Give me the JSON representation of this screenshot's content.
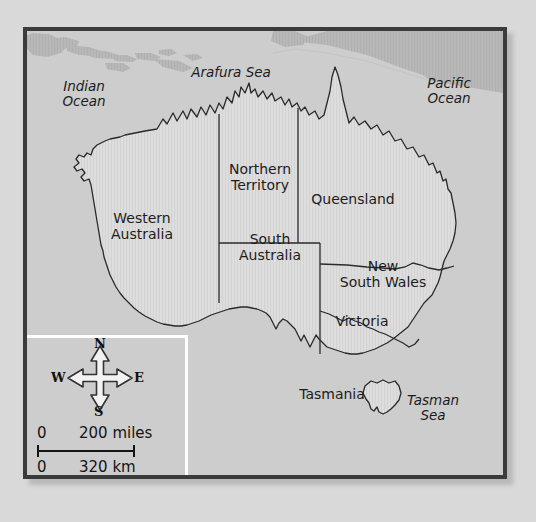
{
  "figure": {
    "type": "political-map",
    "region": "Australia",
    "colors": {
      "page_background": "#d9d9d9",
      "frame_border": "#3b3b3b",
      "ocean_fill": "#cdcdcd",
      "land_fill": "#dcdcdc",
      "foreign_land_fill": "#b6b6b6",
      "coastline_stroke": "#2a2a2a",
      "border_stroke": "#2a2a2a",
      "label_text": "#1c1c1c",
      "inset_divider": "#ffffff"
    }
  },
  "water_labels": [
    {
      "name": "indian-ocean",
      "text": "Indian\nOcean",
      "x": 48,
      "y": 57
    },
    {
      "name": "arafura-sea",
      "text": "Arafura Sea",
      "x": 185,
      "y": 40
    },
    {
      "name": "pacific-ocean",
      "text": "Pacific\nOcean",
      "x": 390,
      "y": 53
    },
    {
      "name": "tasman-sea",
      "text": "Tasman\nSea",
      "x": 370,
      "y": 372
    }
  ],
  "state_labels": [
    {
      "name": "western-australia",
      "text": "Western\nAustralia",
      "x": 90,
      "y": 178
    },
    {
      "name": "northern-territory",
      "text": "Northern\nTerritory",
      "x": 195,
      "y": 130
    },
    {
      "name": "queensland",
      "text": "Queensland",
      "x": 283,
      "y": 159
    },
    {
      "name": "south-australia",
      "text": "South\nAustralia",
      "x": 203,
      "y": 204
    },
    {
      "name": "new-south-wales",
      "text": "New\nSouth Wales",
      "x": 315,
      "y": 240
    },
    {
      "name": "victoria",
      "text": "Victoria",
      "x": 318,
      "y": 305
    },
    {
      "name": "tasmania",
      "text": "Tasmania",
      "x": 277,
      "y": 368
    }
  ],
  "compass": {
    "north": "N",
    "south": "S",
    "east": "E",
    "west": "W"
  },
  "scale_bar": {
    "miles": {
      "zero": "0",
      "value": "200 miles"
    },
    "km": {
      "zero": "0",
      "value": "320 km"
    }
  }
}
